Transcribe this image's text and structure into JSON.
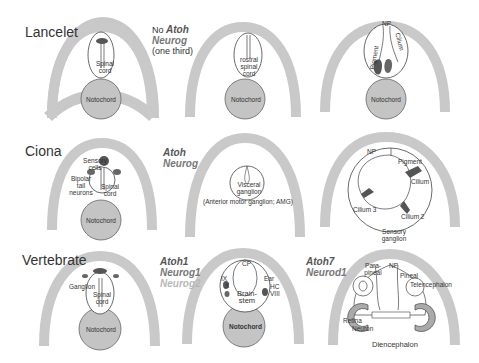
{
  "rows": [
    {
      "title": "Lancelet",
      "genes": {
        "prefix": "No",
        "lines": [
          "Atoh",
          "Neurog"
        ],
        "note": "(one third)"
      },
      "panels": [
        {
          "labels": [
            "Spinal cord",
            "Notochord"
          ]
        },
        {
          "labels": [
            "rostral spinal cord",
            "Notochord"
          ]
        },
        {
          "labels": [
            "NP",
            "Pigment",
            "Cilium",
            "Notochord"
          ]
        }
      ]
    },
    {
      "title": "Ciona",
      "genes": {
        "lines": [
          "Atoh",
          "Neurog"
        ]
      },
      "panels": [
        {
          "labels": [
            "Sensory cells",
            "Bipolar tail neurons",
            "Spinal cord",
            "Notochord"
          ]
        },
        {
          "labels": [
            "Visceral ganglion",
            "(Anterior motor ganglion; AMG)"
          ]
        },
        {
          "labels": [
            "NP",
            "Pigment",
            "Cilium",
            "Cilium 3",
            "Cilium 2",
            "Sensory ganglion"
          ]
        }
      ]
    },
    {
      "title": "Vertebrate",
      "genes": {
        "lines": [
          "Atoh1",
          "Neurog1",
          "Neurog2"
        ]
      },
      "genes2": {
        "lines": [
          "Atoh7",
          "Neurod1"
        ]
      },
      "panels": [
        {
          "labels": [
            "Ganglion",
            "Spinal cord",
            "Notochord"
          ]
        },
        {
          "labels": [
            "CP",
            "IX",
            "X",
            "Ear",
            "HC",
            "VIII",
            "Brain-stem",
            "Notochord"
          ]
        },
        {
          "labels": [
            "Para-pineal",
            "NP",
            "Pineal",
            "Telencephalon",
            "Retina",
            "Neuron",
            "Diencephalon"
          ]
        }
      ]
    }
  ],
  "colors": {
    "arc": "#c8c8c8",
    "notochord": "#c4c4c4",
    "gene_dark": "#555555",
    "gene_mid": "#777777",
    "gene_light": "#b8b8b8",
    "text": "#333333"
  }
}
